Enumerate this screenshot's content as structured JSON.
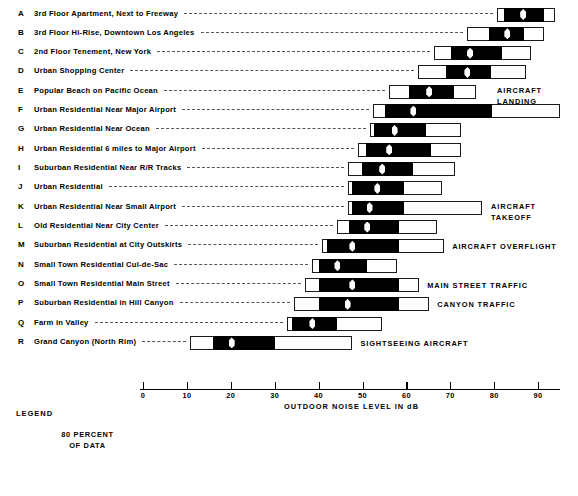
{
  "chart_data": {
    "type": "bar",
    "subtype": "box-and-whisker (percentile ranges)",
    "title": "",
    "xlabel": "OUTDOOR NOISE LEVEL IN dB",
    "ylabel": "",
    "xlim": [
      0,
      95
    ],
    "xticks": [
      0,
      10,
      20,
      30,
      40,
      50,
      60,
      70,
      80,
      90
    ],
    "xticklabels": [
      "0",
      "10",
      "20",
      "30",
      "40",
      "50",
      "60",
      "70",
      "80",
      "90"
    ],
    "grid": false,
    "legend_position": "bottom-left",
    "value_units": "dB",
    "box_meaning": "black segment = 80 percent of data (90th to 10th percentile); outer white box = 99th to 1st percentile; white diamond = 50th percentile (median)",
    "categories": [
      {
        "key": "A",
        "label": "3rd Floor Apartment, Next to Freeway",
        "outer_min": 80.7,
        "outer_max": 93.9,
        "box_min": 82.3,
        "box_max": 91.4,
        "median": 86.6,
        "annotation": ""
      },
      {
        "key": "B",
        "label": "3rd Floor Hi-Rise, Downtown Los Angeles",
        "outer_min": 73.9,
        "outer_max": 91.4,
        "box_min": 78.9,
        "box_max": 86.8,
        "median": 83.0,
        "annotation": ""
      },
      {
        "key": "C",
        "label": "2nd Floor Tenement, New York",
        "outer_min": 66.4,
        "outer_max": 88.4,
        "box_min": 70.2,
        "box_max": 81.8,
        "median": 74.5,
        "annotation": ""
      },
      {
        "key": "D",
        "label": "Urban Shopping Center",
        "outer_min": 62.7,
        "outer_max": 87.3,
        "box_min": 69.1,
        "box_max": 79.3,
        "median": 73.9,
        "annotation": ""
      },
      {
        "key": "E",
        "label": "Popular Beach on Pacific Ocean",
        "outer_min": 56.1,
        "outer_max": 75.9,
        "box_min": 60.7,
        "box_max": 70.9,
        "median": 65.2,
        "annotation": "AIRCRAFT LANDING"
      },
      {
        "key": "F",
        "label": "Urban Residential Near Major Airport",
        "outer_min": 52.3,
        "outer_max": 95.0,
        "box_min": 55.2,
        "box_max": 79.5,
        "median": 61.6,
        "annotation": ""
      },
      {
        "key": "G",
        "label": "Urban Residential Near Ocean",
        "outer_min": 51.6,
        "outer_max": 72.5,
        "box_min": 52.7,
        "box_max": 64.5,
        "median": 57.3,
        "annotation": ""
      },
      {
        "key": "H",
        "label": "Urban Residential 6 miles to Major Airport",
        "outer_min": 48.9,
        "outer_max": 72.5,
        "box_min": 50.9,
        "box_max": 65.7,
        "median": 56.1,
        "annotation": ""
      },
      {
        "key": "I",
        "label": "Suburban Residential Near R/R Tracks",
        "outer_min": 46.6,
        "outer_max": 71.1,
        "box_min": 49.8,
        "box_max": 61.6,
        "median": 54.5,
        "annotation": ""
      },
      {
        "key": "J",
        "label": "Urban Residential",
        "outer_min": 46.6,
        "outer_max": 68.2,
        "box_min": 47.5,
        "box_max": 59.5,
        "median": 53.4,
        "annotation": ""
      },
      {
        "key": "K",
        "label": "Urban Residential Near Small Airport",
        "outer_min": 46.6,
        "outer_max": 77.3,
        "box_min": 47.5,
        "box_max": 59.5,
        "median": 51.6,
        "annotation": "AIRCRAFT TAKEOFF"
      },
      {
        "key": "L",
        "label": "Old Residential Near City Center",
        "outer_min": 44.1,
        "outer_max": 67.0,
        "box_min": 47.0,
        "box_max": 58.4,
        "median": 51.1,
        "annotation": ""
      },
      {
        "key": "M",
        "label": "Suburban Residential at City Outskirts",
        "outer_min": 40.7,
        "outer_max": 68.6,
        "box_min": 41.8,
        "box_max": 58.4,
        "median": 47.7,
        "annotation": "AIRCRAFT OVERFLIGHT"
      },
      {
        "key": "N",
        "label": "Small Town Residential Cul-de-Sac",
        "outer_min": 38.6,
        "outer_max": 57.9,
        "box_min": 40.2,
        "box_max": 51.1,
        "median": 44.3,
        "annotation": ""
      },
      {
        "key": "O",
        "label": "Small Town Residential Main Street",
        "outer_min": 36.8,
        "outer_max": 62.9,
        "box_min": 40.2,
        "box_max": 58.4,
        "median": 47.7,
        "annotation": "MAIN STREET TRAFFIC"
      },
      {
        "key": "P",
        "label": "Suburban Residential in Hill Canyon",
        "outer_min": 34.5,
        "outer_max": 65.2,
        "box_min": 40.2,
        "box_max": 58.4,
        "median": 46.6,
        "annotation": "CANYON TRAFFIC"
      },
      {
        "key": "Q",
        "label": "Farm in Valley",
        "outer_min": 32.7,
        "outer_max": 54.5,
        "box_min": 33.9,
        "box_max": 44.1,
        "median": 38.6,
        "annotation": ""
      },
      {
        "key": "R",
        "label": "Grand Canyon (North Rim)",
        "outer_min": 10.7,
        "outer_max": 47.7,
        "box_min": 15.9,
        "box_max": 30.0,
        "median": 20.2,
        "annotation": "SIGHTSEEING AIRCRAFT"
      }
    ]
  },
  "legend": {
    "title": "LEGEND",
    "caption_line1": "80 PERCENT",
    "caption_line2": "OF DATA",
    "ticklabels": [
      "99",
      "90",
      "50",
      "10",
      "1"
    ]
  },
  "colors": {
    "box_fill": "#000000",
    "outer_fill": "#ffffff",
    "stroke": "#1a1a1a",
    "median_marker": "#ffffff",
    "background": "#ffffff"
  }
}
